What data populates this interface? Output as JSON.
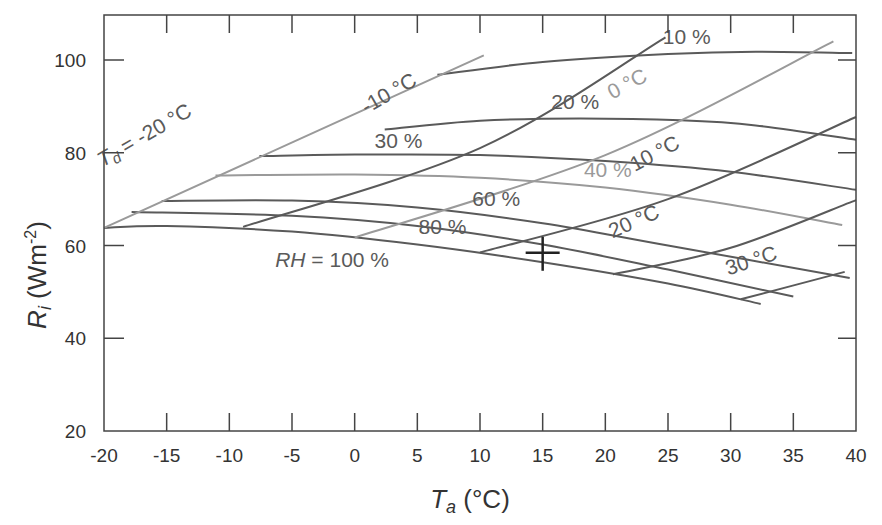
{
  "chart_data": {
    "type": "line",
    "title": "",
    "xlabel": "T_a (°C)",
    "xlabel_main": "T",
    "xlabel_sub": "a",
    "xlabel_unit": " (°C)",
    "ylabel": "R_i (Wm^-2)",
    "ylabel_main": "R",
    "ylabel_sub": "i",
    "ylabel_unit_pre": " (Wm",
    "ylabel_unit_sup": "-2",
    "ylabel_unit_post": ")",
    "xlim": [
      -20,
      40
    ],
    "ylim": [
      20,
      110
    ],
    "x_ticks": [
      -20,
      -15,
      -10,
      -5,
      0,
      5,
      10,
      15,
      20,
      25,
      30,
      35,
      40
    ],
    "x_tick_labels": [
      "-20",
      "-15",
      "-10",
      "-5",
      "0",
      "5",
      "10",
      "15",
      "20",
      "25",
      "30",
      "35",
      "40"
    ],
    "y_ticks": [
      20,
      40,
      60,
      80,
      100
    ],
    "y_tick_labels": [
      "20",
      "40",
      "60",
      "80",
      "100"
    ],
    "grid": false,
    "legend": null,
    "series": [
      {
        "name": "RH = 10 %",
        "family": "RH",
        "color": "#5a5a5a",
        "x": [
          6.6,
          15,
          25,
          32,
          39.7
        ],
        "y": [
          96.8,
          99.6,
          101.3,
          101.8,
          101.5
        ]
      },
      {
        "name": "RH = 20 %",
        "family": "RH",
        "color": "#5a5a5a",
        "x": [
          2.4,
          10,
          18,
          26,
          32,
          40
        ],
        "y": [
          85.0,
          86.9,
          87.4,
          87.0,
          85.9,
          82.8
        ]
      },
      {
        "name": "RH = 30 %",
        "family": "RH",
        "color": "#5a5a5a",
        "x": [
          -7.6,
          0,
          10,
          20,
          30,
          40
        ],
        "y": [
          79.3,
          79.6,
          79.5,
          78.2,
          75.9,
          72.0
        ]
      },
      {
        "name": "RH = 40 %",
        "family": "RH",
        "color": "#9a9a9a",
        "x": [
          -11.1,
          0,
          10,
          20,
          30,
          38.9
        ],
        "y": [
          75.1,
          75.3,
          74.6,
          72.5,
          68.8,
          64.4
        ]
      },
      {
        "name": "RH = 60 %",
        "family": "RH",
        "color": "#5a5a5a",
        "x": [
          -15.4,
          -5,
          5,
          15,
          25,
          39.5
        ],
        "y": [
          69.6,
          69.7,
          68.2,
          64.8,
          60.0,
          53.0
        ]
      },
      {
        "name": "RH = 80 %",
        "family": "RH",
        "color": "#5a5a5a",
        "x": [
          -17.8,
          -5,
          5,
          15,
          25,
          35
        ],
        "y": [
          67.2,
          66.4,
          64.2,
          60.2,
          54.8,
          49.0
        ]
      },
      {
        "name": "RH = 100 %",
        "family": "RH",
        "color": "#5a5a5a",
        "x": [
          -20,
          -15,
          -5,
          5,
          15,
          25,
          32.4
        ],
        "y": [
          63.8,
          64.2,
          63.0,
          60.2,
          56.4,
          51.8,
          47.4
        ]
      },
      {
        "name": "Td = -20 °C",
        "family": "Td",
        "color": "#9a9a9a",
        "x": [
          -20,
          10.3
        ],
        "y": [
          63.8,
          101.0
        ]
      },
      {
        "name": "Td = -10 °C",
        "family": "Td",
        "color": "#5a5a5a",
        "x": [
          -8.9,
          10,
          24.8
        ],
        "y": [
          64.0,
          81.0,
          104.9
        ]
      },
      {
        "name": "Td = 0 °C",
        "family": "Td",
        "color": "#9a9a9a",
        "x": [
          0,
          20,
          38.2
        ],
        "y": [
          61.7,
          79.5,
          104.0
        ]
      },
      {
        "name": "Td = 10 °C",
        "family": "Td",
        "color": "#5a5a5a",
        "x": [
          10,
          25,
          40
        ],
        "y": [
          58.5,
          70.0,
          87.7
        ]
      },
      {
        "name": "Td = 20 °C",
        "family": "Td",
        "color": "#5a5a5a",
        "x": [
          20.6,
          30,
          40
        ],
        "y": [
          53.8,
          59.5,
          69.8
        ]
      },
      {
        "name": "Td = 30 °C",
        "family": "Td",
        "color": "#5a5a5a",
        "x": [
          30.8,
          39.1
        ],
        "y": [
          48.4,
          54.3
        ]
      }
    ],
    "marker": {
      "type": "cross",
      "x": 15,
      "y": 58,
      "label": ""
    },
    "annotations": [
      {
        "text": "10 %",
        "x": 26.5,
        "y": 103.5,
        "color": "#5a5a5a",
        "rotate": 0
      },
      {
        "text": "20 %",
        "x": 17.6,
        "y": 89.5,
        "color": "#5a5a5a",
        "rotate": 0
      },
      {
        "text": "30 %",
        "x": 3.5,
        "y": 81.0,
        "color": "#5a5a5a",
        "rotate": 0
      },
      {
        "text": "40 %",
        "x": 20.2,
        "y": 74.8,
        "color": "#9a9a9a",
        "rotate": 0
      },
      {
        "text": "60 %",
        "x": 11.3,
        "y": 68.5,
        "color": "#5a5a5a",
        "rotate": 0
      },
      {
        "text": "80 %",
        "x": 7.0,
        "y": 62.5,
        "color": "#5a5a5a",
        "rotate": 0
      },
      {
        "text": "RH = 100 %",
        "x": -1.8,
        "y": 55.3,
        "color": "#5a5a5a",
        "rotate": 0,
        "italic_prefix": "RH"
      },
      {
        "text": "Td = -20 °C",
        "x": -16.5,
        "y": 82.5,
        "color": "#5a5a5a",
        "rotate": -30
      },
      {
        "text": "-10 °C",
        "x": 3.0,
        "y": 91.5,
        "color": "#5a5a5a",
        "rotate": -30
      },
      {
        "text": "0 °C",
        "x": 22.0,
        "y": 93.5,
        "color": "#9a9a9a",
        "rotate": -28
      },
      {
        "text": "10 °C",
        "x": 24.2,
        "y": 78.5,
        "color": "#5a5a5a",
        "rotate": -28
      },
      {
        "text": "20 °C",
        "x": 22.5,
        "y": 63.8,
        "color": "#5a5a5a",
        "rotate": -24
      },
      {
        "text": "30 °C",
        "x": 31.8,
        "y": 55.3,
        "color": "#5a5a5a",
        "rotate": -18
      }
    ]
  }
}
